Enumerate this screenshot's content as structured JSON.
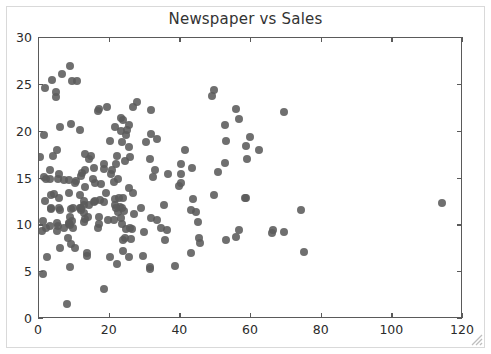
{
  "figure": {
    "width": 491,
    "height": 354,
    "background": "#ffffff",
    "frame_color": "#d9d9d9",
    "axis_color": "#5a5a5a",
    "marker_color": "#5b5b5b",
    "resize_grip": "resize-grip-icon"
  },
  "chart_data": {
    "type": "scatter",
    "title": "Newspaper vs Sales",
    "xlabel": "",
    "ylabel": "",
    "xlim": [
      0,
      120
    ],
    "ylim": [
      0,
      30
    ],
    "xticks": [
      0,
      20,
      40,
      60,
      80,
      100,
      120
    ],
    "yticks": [
      0,
      5,
      10,
      15,
      20,
      25,
      30
    ],
    "xtick_labels": [
      "0",
      "20",
      "40",
      "60",
      "80",
      "100",
      "120"
    ],
    "ytick_labels": [
      "0",
      "5",
      "10",
      "15",
      "20",
      "25",
      "30"
    ],
    "grid": false,
    "legend": null,
    "marker": "circle",
    "marker_size": 8,
    "marker_color": "#5b5b5b",
    "n_points": 200,
    "points": [
      [
        69.2,
        22.1
      ],
      [
        45.1,
        10.4
      ],
      [
        69.3,
        9.3
      ],
      [
        58.5,
        18.5
      ],
      [
        58.4,
        12.9
      ],
      [
        75.0,
        7.2
      ],
      [
        23.5,
        11.8
      ],
      [
        11.6,
        13.2
      ],
      [
        1.0,
        4.8
      ],
      [
        21.2,
        10.6
      ],
      [
        24.2,
        8.6
      ],
      [
        4.0,
        17.4
      ],
      [
        65.9,
        9.2
      ],
      [
        7.2,
        9.7
      ],
      [
        52.9,
        19.0
      ],
      [
        55.8,
        22.4
      ],
      [
        18.3,
        12.5
      ],
      [
        49.4,
        24.4
      ],
      [
        12.6,
        11.3
      ],
      [
        21.2,
        14.6
      ],
      [
        41.2,
        18.0
      ],
      [
        15.6,
        12.5
      ],
      [
        8.7,
        5.6
      ],
      [
        40.3,
        15.5
      ],
      [
        34.6,
        9.7
      ],
      [
        22.9,
        12.0
      ],
      [
        3.0,
        15.0
      ],
      [
        32.8,
        15.9
      ],
      [
        23.6,
        18.9
      ],
      [
        9.3,
        10.5
      ],
      [
        56.5,
        21.4
      ],
      [
        5.7,
        11.9
      ],
      [
        24.6,
        9.6
      ],
      [
        22.1,
        17.4
      ],
      [
        56.5,
        9.5
      ],
      [
        21.6,
        12.8
      ],
      [
        9.3,
        25.4
      ],
      [
        10.6,
        14.7
      ],
      [
        8.6,
        10.1
      ],
      [
        23.2,
        21.5
      ],
      [
        18.5,
        16.6
      ],
      [
        14.2,
        17.1
      ],
      [
        52.7,
        20.7
      ],
      [
        23.8,
        12.9
      ],
      [
        25.9,
        8.5
      ],
      [
        22.3,
        14.9
      ],
      [
        33.4,
        10.6
      ],
      [
        27.7,
        23.2
      ],
      [
        8.4,
        14.8
      ],
      [
        25.7,
        9.7
      ],
      [
        22.3,
        11.4
      ],
      [
        13.1,
        10.7
      ],
      [
        26.7,
        22.6
      ],
      [
        23.7,
        21.2
      ],
      [
        11.6,
        20.2
      ],
      [
        4.8,
        23.7
      ],
      [
        31.3,
        5.5
      ],
      [
        3.5,
        13.2
      ],
      [
        49.0,
        23.8
      ],
      [
        25.5,
        18.4
      ],
      [
        45.7,
        8.1
      ],
      [
        4.9,
        24.2
      ],
      [
        50.6,
        15.7
      ],
      [
        25.6,
        14.0
      ],
      [
        5.2,
        18.0
      ],
      [
        29.7,
        9.3
      ],
      [
        66.1,
        9.5
      ],
      [
        8.4,
        13.4
      ],
      [
        30.2,
        18.9
      ],
      [
        16.7,
        22.2
      ],
      [
        14.8,
        17.4
      ],
      [
        9.6,
        9.7
      ],
      [
        5.5,
        9.9
      ],
      [
        6.0,
        20.5
      ],
      [
        11.8,
        11.6
      ],
      [
        59.0,
        17.1
      ],
      [
        39.6,
        14.2
      ],
      [
        8.7,
        10.0
      ],
      [
        15.9,
        14.5
      ],
      [
        21.4,
        20.5
      ],
      [
        2.1,
        14.9
      ],
      [
        1.6,
        12.6
      ],
      [
        21.6,
        12.2
      ],
      [
        0.8,
        9.4
      ],
      [
        3.2,
        15.9
      ],
      [
        25.6,
        6.6
      ],
      [
        5.7,
        15.5
      ],
      [
        13.6,
        7.0
      ],
      [
        21.8,
        16.6
      ],
      [
        1.3,
        15.2
      ],
      [
        31.6,
        19.7
      ],
      [
        19.5,
        10.6
      ],
      [
        2.4,
        6.6
      ],
      [
        55.8,
        8.8
      ],
      [
        1.8,
        24.7
      ],
      [
        1.9,
        9.7
      ],
      [
        8.0,
        1.6
      ],
      [
        17.4,
        12.7
      ],
      [
        38.6,
        5.7
      ],
      [
        24.7,
        19.6
      ],
      [
        31.7,
        10.8
      ],
      [
        43.1,
        11.6
      ],
      [
        36.3,
        9.5
      ],
      [
        9.0,
        20.8
      ],
      [
        26.2,
        9.6
      ],
      [
        25.6,
        20.7
      ],
      [
        8.7,
        10.9
      ],
      [
        33.5,
        19.2
      ],
      [
        23.3,
        20.1
      ],
      [
        12.6,
        10.4
      ],
      [
        44.3,
        11.4
      ],
      [
        5.1,
        10.3
      ],
      [
        49.4,
        13.2
      ],
      [
        10.8,
        25.4
      ],
      [
        17.0,
        10.9
      ],
      [
        23.6,
        10.1
      ],
      [
        15.5,
        16.1
      ],
      [
        74.2,
        11.6
      ],
      [
        40.3,
        16.6
      ],
      [
        20.1,
        19.0
      ],
      [
        12.2,
        15.6
      ],
      [
        18.4,
        3.2
      ],
      [
        11.8,
        15.3
      ],
      [
        17.0,
        10.1
      ],
      [
        23.9,
        7.3
      ],
      [
        5.6,
        12.9
      ],
      [
        17.6,
        14.4
      ],
      [
        4.2,
        13.3
      ],
      [
        15.4,
        14.9
      ],
      [
        62.3,
        18.0
      ],
      [
        9.5,
        11.9
      ],
      [
        28.9,
        11.9
      ],
      [
        9.0,
        8.0
      ],
      [
        14.2,
        12.2
      ],
      [
        31.3,
        17.1
      ],
      [
        5.4,
        15.0
      ],
      [
        35.8,
        8.4
      ],
      [
        40.1,
        14.5
      ],
      [
        10.1,
        7.6
      ],
      [
        9.1,
        11.7
      ],
      [
        24.0,
        11.5
      ],
      [
        8.7,
        27.0
      ],
      [
        25.0,
        20.2
      ],
      [
        3.4,
        11.7
      ],
      [
        12.0,
        11.8
      ],
      [
        12.8,
        12.6
      ],
      [
        1.2,
        10.5
      ],
      [
        35.5,
        12.2
      ],
      [
        8.2,
        8.7
      ],
      [
        6.4,
        26.2
      ],
      [
        12.9,
        17.6
      ],
      [
        19.2,
        22.6
      ],
      [
        8.6,
        10.3
      ],
      [
        0.4,
        17.3
      ],
      [
        20.6,
        15.9
      ],
      [
        29.5,
        6.7
      ],
      [
        23.2,
        10.8
      ],
      [
        3.2,
        9.9
      ],
      [
        22.0,
        5.9
      ],
      [
        1.4,
        19.6
      ],
      [
        25.8,
        17.3
      ],
      [
        5.9,
        7.6
      ],
      [
        16.7,
        9.7
      ],
      [
        43.7,
        12.8
      ],
      [
        3.6,
        25.5
      ],
      [
        19.1,
        13.4
      ],
      [
        23.8,
        8.4
      ],
      [
        22.6,
        12.9
      ],
      [
        7.1,
        14.8
      ],
      [
        13.8,
        10.9
      ],
      [
        13.1,
        14.1
      ],
      [
        15.8,
        12.6
      ],
      [
        12.6,
        12.2
      ],
      [
        5.1,
        9.4
      ],
      [
        13.1,
        15.9
      ],
      [
        20.1,
        6.6
      ],
      [
        36.6,
        15.5
      ],
      [
        43.0,
        7.0
      ],
      [
        24.3,
        16.9
      ],
      [
        52.7,
        16.7
      ],
      [
        10.2,
        14.5
      ],
      [
        45.2,
        8.7
      ],
      [
        32.3,
        15.2
      ],
      [
        58.5,
        12.9
      ],
      [
        31.6,
        22.3
      ],
      [
        3.5,
        11.8
      ],
      [
        43.2,
        16.1
      ],
      [
        11.7,
        11.9
      ],
      [
        31.5,
        5.3
      ],
      [
        59.7,
        19.4
      ],
      [
        17.0,
        22.4
      ],
      [
        6.0,
        11.6
      ],
      [
        20.4,
        15.5
      ],
      [
        13.7,
        6.7
      ],
      [
        21.8,
        11.9
      ],
      [
        26.9,
        11.2
      ],
      [
        18.3,
        16.0
      ],
      [
        26.6,
        13.4
      ],
      [
        52.9,
        8.4
      ],
      [
        114.0,
        12.4
      ]
    ]
  }
}
